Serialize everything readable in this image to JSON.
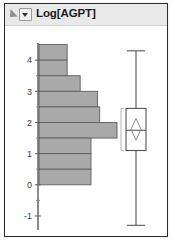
{
  "window": {
    "title": "Log[AGPT]",
    "disclosure_icon": "disclosure-triangle-icon",
    "menu_icon": "chevron-down-icon"
  },
  "chart_data": {
    "type": "bar",
    "title": "Log[AGPT]",
    "orientation": "horizontal",
    "xlabel": "",
    "ylabel": "Log[AGPT]",
    "ylim": [
      -1.5,
      4.5
    ],
    "grid": false,
    "axis_ticks": [
      4,
      3,
      2,
      1,
      0,
      -1
    ],
    "axis_tick_labels": [
      "4",
      "3",
      "2",
      "1",
      "0",
      "-1"
    ],
    "bin_width": 0.5,
    "bin_centers": [
      4.25,
      3.75,
      3.25,
      2.75,
      2.25,
      1.75,
      1.25,
      0.75,
      0.25
    ],
    "bin_lows": [
      4.0,
      3.5,
      3.0,
      2.5,
      2.0,
      1.5,
      1.0,
      0.5,
      0.0
    ],
    "bin_highs": [
      4.5,
      4.0,
      3.5,
      3.0,
      2.5,
      2.0,
      1.5,
      1.0,
      0.5
    ],
    "counts": [
      13,
      13,
      19,
      27,
      28,
      36,
      24,
      24,
      24
    ],
    "bar_color": "#a9a9a9",
    "bar_edge_color": "#5e5e5e",
    "boxplot": {
      "label": "box-plot",
      "whisker_low": -1.3,
      "q1": 1.1,
      "median": 1.75,
      "q3": 2.45,
      "whisker_high": 4.3,
      "mean": 1.78,
      "mean_marker": "diamond",
      "line_color": "#555555",
      "box_fill": "#ffffff"
    }
  }
}
